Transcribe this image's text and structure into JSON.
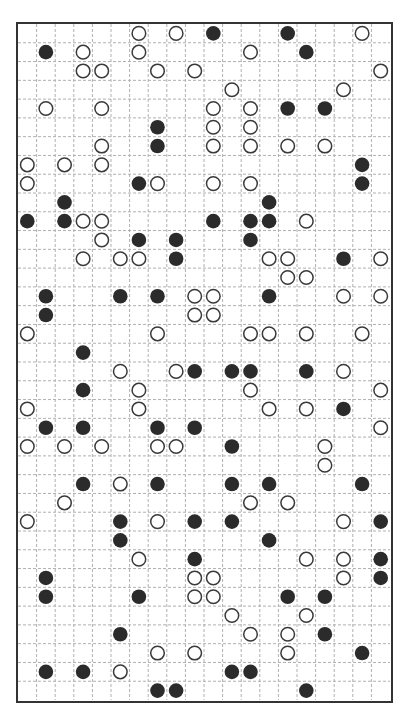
{
  "puzzle": {
    "type": "masyu",
    "cols": 20,
    "rows": 36,
    "colors": {
      "border": "#333333",
      "grid_line": "#b0b0b0",
      "black_pearl": "#2b2b2b",
      "white_pearl_stroke": "#3a3a3a",
      "white_pearl_fill": "#ffffff"
    },
    "pearls": [
      {
        "r": 0,
        "c": 6,
        "t": "W"
      },
      {
        "r": 0,
        "c": 8,
        "t": "W"
      },
      {
        "r": 0,
        "c": 10,
        "t": "B"
      },
      {
        "r": 0,
        "c": 14,
        "t": "B"
      },
      {
        "r": 0,
        "c": 18,
        "t": "W"
      },
      {
        "r": 1,
        "c": 1,
        "t": "B"
      },
      {
        "r": 1,
        "c": 3,
        "t": "W"
      },
      {
        "r": 1,
        "c": 6,
        "t": "W"
      },
      {
        "r": 1,
        "c": 12,
        "t": "W"
      },
      {
        "r": 1,
        "c": 15,
        "t": "B"
      },
      {
        "r": 2,
        "c": 3,
        "t": "W"
      },
      {
        "r": 2,
        "c": 4,
        "t": "W"
      },
      {
        "r": 2,
        "c": 7,
        "t": "W"
      },
      {
        "r": 2,
        "c": 9,
        "t": "W"
      },
      {
        "r": 2,
        "c": 19,
        "t": "W"
      },
      {
        "r": 3,
        "c": 11,
        "t": "W"
      },
      {
        "r": 3,
        "c": 17,
        "t": "W"
      },
      {
        "r": 4,
        "c": 1,
        "t": "W"
      },
      {
        "r": 4,
        "c": 4,
        "t": "W"
      },
      {
        "r": 4,
        "c": 10,
        "t": "W"
      },
      {
        "r": 4,
        "c": 12,
        "t": "W"
      },
      {
        "r": 4,
        "c": 14,
        "t": "B"
      },
      {
        "r": 4,
        "c": 16,
        "t": "B"
      },
      {
        "r": 5,
        "c": 7,
        "t": "B"
      },
      {
        "r": 5,
        "c": 10,
        "t": "W"
      },
      {
        "r": 5,
        "c": 12,
        "t": "W"
      },
      {
        "r": 6,
        "c": 4,
        "t": "W"
      },
      {
        "r": 6,
        "c": 7,
        "t": "B"
      },
      {
        "r": 6,
        "c": 10,
        "t": "W"
      },
      {
        "r": 6,
        "c": 12,
        "t": "W"
      },
      {
        "r": 6,
        "c": 14,
        "t": "W"
      },
      {
        "r": 6,
        "c": 16,
        "t": "W"
      },
      {
        "r": 7,
        "c": 0,
        "t": "W"
      },
      {
        "r": 7,
        "c": 2,
        "t": "W"
      },
      {
        "r": 7,
        "c": 4,
        "t": "W"
      },
      {
        "r": 7,
        "c": 18,
        "t": "B"
      },
      {
        "r": 8,
        "c": 0,
        "t": "W"
      },
      {
        "r": 8,
        "c": 6,
        "t": "B"
      },
      {
        "r": 8,
        "c": 7,
        "t": "W"
      },
      {
        "r": 8,
        "c": 10,
        "t": "W"
      },
      {
        "r": 8,
        "c": 12,
        "t": "W"
      },
      {
        "r": 8,
        "c": 18,
        "t": "B"
      },
      {
        "r": 9,
        "c": 2,
        "t": "B"
      },
      {
        "r": 9,
        "c": 13,
        "t": "B"
      },
      {
        "r": 10,
        "c": 0,
        "t": "B"
      },
      {
        "r": 10,
        "c": 2,
        "t": "B"
      },
      {
        "r": 10,
        "c": 3,
        "t": "W"
      },
      {
        "r": 10,
        "c": 4,
        "t": "W"
      },
      {
        "r": 10,
        "c": 10,
        "t": "B"
      },
      {
        "r": 10,
        "c": 12,
        "t": "B"
      },
      {
        "r": 10,
        "c": 13,
        "t": "B"
      },
      {
        "r": 10,
        "c": 15,
        "t": "W"
      },
      {
        "r": 11,
        "c": 4,
        "t": "W"
      },
      {
        "r": 11,
        "c": 6,
        "t": "B"
      },
      {
        "r": 11,
        "c": 8,
        "t": "B"
      },
      {
        "r": 11,
        "c": 12,
        "t": "B"
      },
      {
        "r": 12,
        "c": 3,
        "t": "W"
      },
      {
        "r": 12,
        "c": 5,
        "t": "W"
      },
      {
        "r": 12,
        "c": 6,
        "t": "W"
      },
      {
        "r": 12,
        "c": 8,
        "t": "B"
      },
      {
        "r": 12,
        "c": 13,
        "t": "W"
      },
      {
        "r": 12,
        "c": 14,
        "t": "W"
      },
      {
        "r": 12,
        "c": 17,
        "t": "B"
      },
      {
        "r": 12,
        "c": 19,
        "t": "W"
      },
      {
        "r": 13,
        "c": 14,
        "t": "W"
      },
      {
        "r": 13,
        "c": 15,
        "t": "W"
      },
      {
        "r": 14,
        "c": 1,
        "t": "B"
      },
      {
        "r": 14,
        "c": 5,
        "t": "B"
      },
      {
        "r": 14,
        "c": 7,
        "t": "B"
      },
      {
        "r": 14,
        "c": 9,
        "t": "W"
      },
      {
        "r": 14,
        "c": 10,
        "t": "W"
      },
      {
        "r": 14,
        "c": 13,
        "t": "B"
      },
      {
        "r": 14,
        "c": 17,
        "t": "W"
      },
      {
        "r": 14,
        "c": 19,
        "t": "W"
      },
      {
        "r": 15,
        "c": 1,
        "t": "B"
      },
      {
        "r": 15,
        "c": 9,
        "t": "W"
      },
      {
        "r": 15,
        "c": 10,
        "t": "W"
      },
      {
        "r": 16,
        "c": 0,
        "t": "W"
      },
      {
        "r": 16,
        "c": 7,
        "t": "W"
      },
      {
        "r": 16,
        "c": 12,
        "t": "W"
      },
      {
        "r": 16,
        "c": 13,
        "t": "W"
      },
      {
        "r": 16,
        "c": 15,
        "t": "W"
      },
      {
        "r": 16,
        "c": 18,
        "t": "W"
      },
      {
        "r": 17,
        "c": 3,
        "t": "B"
      },
      {
        "r": 18,
        "c": 5,
        "t": "W"
      },
      {
        "r": 18,
        "c": 8,
        "t": "W"
      },
      {
        "r": 18,
        "c": 9,
        "t": "B"
      },
      {
        "r": 18,
        "c": 11,
        "t": "B"
      },
      {
        "r": 18,
        "c": 12,
        "t": "B"
      },
      {
        "r": 18,
        "c": 15,
        "t": "B"
      },
      {
        "r": 18,
        "c": 17,
        "t": "W"
      },
      {
        "r": 19,
        "c": 3,
        "t": "B"
      },
      {
        "r": 19,
        "c": 6,
        "t": "W"
      },
      {
        "r": 19,
        "c": 12,
        "t": "W"
      },
      {
        "r": 19,
        "c": 19,
        "t": "W"
      },
      {
        "r": 20,
        "c": 0,
        "t": "W"
      },
      {
        "r": 20,
        "c": 6,
        "t": "W"
      },
      {
        "r": 20,
        "c": 13,
        "t": "W"
      },
      {
        "r": 20,
        "c": 15,
        "t": "W"
      },
      {
        "r": 20,
        "c": 17,
        "t": "B"
      },
      {
        "r": 21,
        "c": 1,
        "t": "B"
      },
      {
        "r": 21,
        "c": 3,
        "t": "B"
      },
      {
        "r": 21,
        "c": 7,
        "t": "B"
      },
      {
        "r": 21,
        "c": 9,
        "t": "B"
      },
      {
        "r": 21,
        "c": 19,
        "t": "W"
      },
      {
        "r": 22,
        "c": 0,
        "t": "W"
      },
      {
        "r": 22,
        "c": 2,
        "t": "W"
      },
      {
        "r": 22,
        "c": 4,
        "t": "W"
      },
      {
        "r": 22,
        "c": 7,
        "t": "W"
      },
      {
        "r": 22,
        "c": 8,
        "t": "W"
      },
      {
        "r": 22,
        "c": 11,
        "t": "B"
      },
      {
        "r": 22,
        "c": 16,
        "t": "W"
      },
      {
        "r": 23,
        "c": 16,
        "t": "W"
      },
      {
        "r": 24,
        "c": 3,
        "t": "B"
      },
      {
        "r": 24,
        "c": 5,
        "t": "W"
      },
      {
        "r": 24,
        "c": 7,
        "t": "B"
      },
      {
        "r": 24,
        "c": 11,
        "t": "B"
      },
      {
        "r": 24,
        "c": 13,
        "t": "B"
      },
      {
        "r": 24,
        "c": 18,
        "t": "B"
      },
      {
        "r": 25,
        "c": 2,
        "t": "W"
      },
      {
        "r": 25,
        "c": 12,
        "t": "W"
      },
      {
        "r": 25,
        "c": 14,
        "t": "W"
      },
      {
        "r": 26,
        "c": 0,
        "t": "W"
      },
      {
        "r": 26,
        "c": 5,
        "t": "B"
      },
      {
        "r": 26,
        "c": 7,
        "t": "W"
      },
      {
        "r": 26,
        "c": 9,
        "t": "B"
      },
      {
        "r": 26,
        "c": 11,
        "t": "B"
      },
      {
        "r": 26,
        "c": 17,
        "t": "W"
      },
      {
        "r": 26,
        "c": 19,
        "t": "B"
      },
      {
        "r": 27,
        "c": 5,
        "t": "B"
      },
      {
        "r": 27,
        "c": 13,
        "t": "B"
      },
      {
        "r": 28,
        "c": 6,
        "t": "W"
      },
      {
        "r": 28,
        "c": 9,
        "t": "B"
      },
      {
        "r": 28,
        "c": 15,
        "t": "W"
      },
      {
        "r": 28,
        "c": 17,
        "t": "W"
      },
      {
        "r": 28,
        "c": 19,
        "t": "B"
      },
      {
        "r": 29,
        "c": 1,
        "t": "B"
      },
      {
        "r": 29,
        "c": 9,
        "t": "W"
      },
      {
        "r": 29,
        "c": 10,
        "t": "W"
      },
      {
        "r": 29,
        "c": 17,
        "t": "W"
      },
      {
        "r": 29,
        "c": 19,
        "t": "B"
      },
      {
        "r": 30,
        "c": 1,
        "t": "B"
      },
      {
        "r": 30,
        "c": 6,
        "t": "B"
      },
      {
        "r": 30,
        "c": 9,
        "t": "W"
      },
      {
        "r": 30,
        "c": 10,
        "t": "W"
      },
      {
        "r": 30,
        "c": 14,
        "t": "B"
      },
      {
        "r": 30,
        "c": 16,
        "t": "B"
      },
      {
        "r": 31,
        "c": 11,
        "t": "W"
      },
      {
        "r": 31,
        "c": 15,
        "t": "W"
      },
      {
        "r": 32,
        "c": 5,
        "t": "B"
      },
      {
        "r": 32,
        "c": 12,
        "t": "W"
      },
      {
        "r": 32,
        "c": 14,
        "t": "W"
      },
      {
        "r": 32,
        "c": 16,
        "t": "B"
      },
      {
        "r": 33,
        "c": 7,
        "t": "W"
      },
      {
        "r": 33,
        "c": 9,
        "t": "W"
      },
      {
        "r": 33,
        "c": 14,
        "t": "W"
      },
      {
        "r": 33,
        "c": 18,
        "t": "B"
      },
      {
        "r": 34,
        "c": 1,
        "t": "B"
      },
      {
        "r": 34,
        "c": 3,
        "t": "B"
      },
      {
        "r": 34,
        "c": 5,
        "t": "W"
      },
      {
        "r": 34,
        "c": 11,
        "t": "B"
      },
      {
        "r": 34,
        "c": 12,
        "t": "B"
      },
      {
        "r": 35,
        "c": 7,
        "t": "B"
      },
      {
        "r": 35,
        "c": 8,
        "t": "B"
      },
      {
        "r": 35,
        "c": 15,
        "t": "B"
      }
    ]
  }
}
